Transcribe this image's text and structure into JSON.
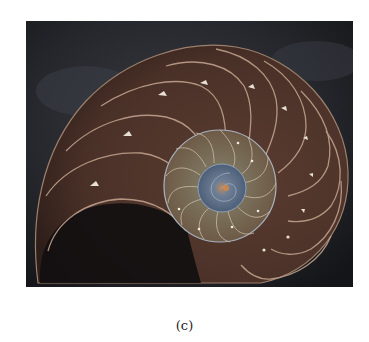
{
  "figure": {
    "caption": "(c)",
    "colors": {
      "background": "#ffffff",
      "photo_bg": "#1e2024",
      "shell_brown": "#4a3128",
      "chamber_edge": "#b89a86",
      "inner_coil": "#7a6a52",
      "center": "#5b6e86"
    }
  }
}
